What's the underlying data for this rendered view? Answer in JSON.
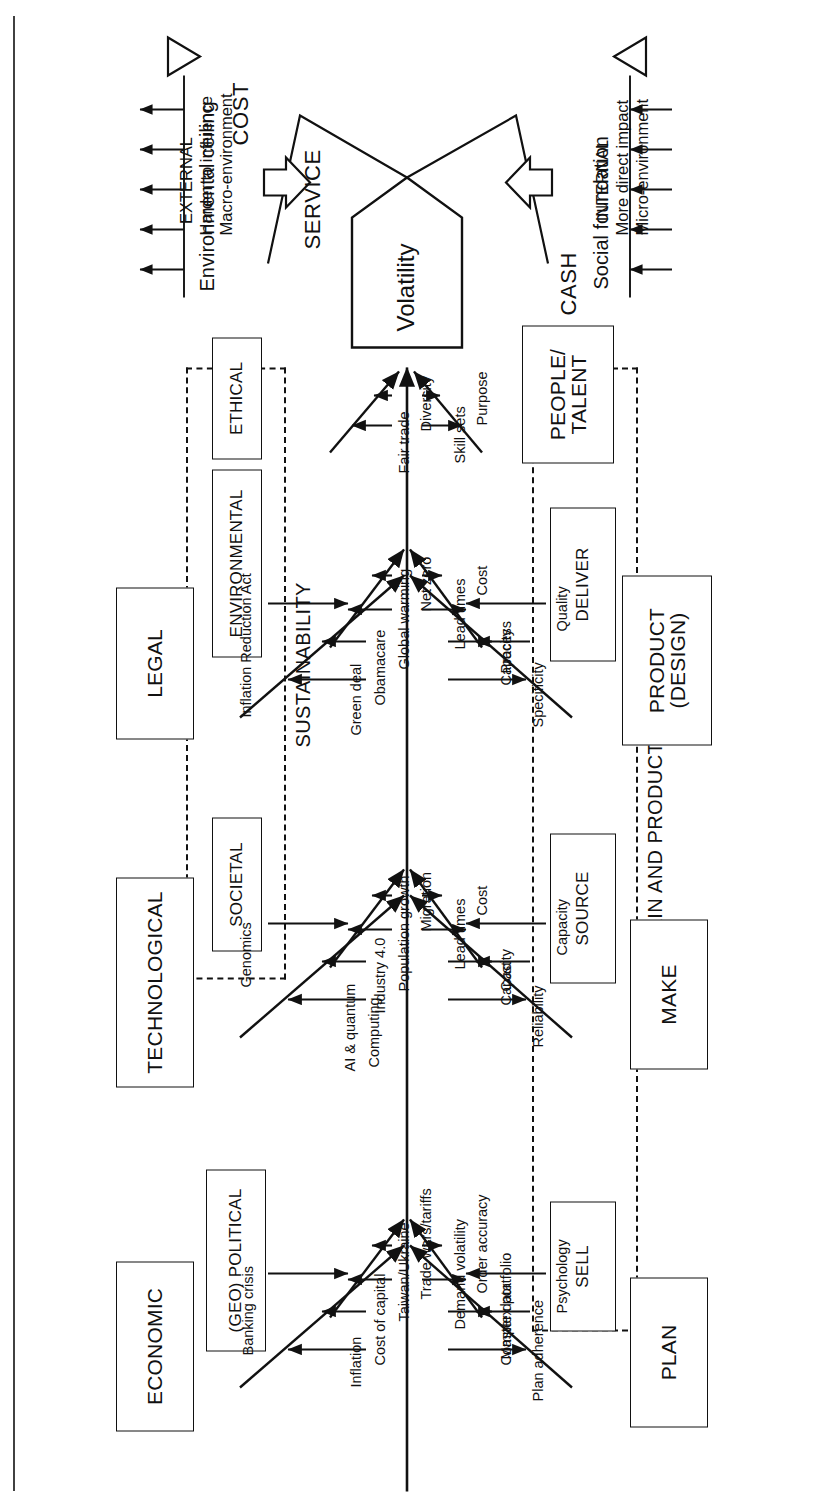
{
  "diagram": {
    "head_label": "Volatility",
    "external": {
      "line1": "EXTERNAL",
      "line2": "Harder to influence",
      "line3": "Macro-environment",
      "arrow_icon": "arrow-right-outline"
    },
    "internal": {
      "line1": "INTERNAL",
      "line2": "More direct impact",
      "line3": "Micro-environment",
      "arrow_icon": "arrow-left-outline"
    },
    "ceiling": {
      "label": "Environmental ceiling",
      "marker_icon": "triangle-down-outline",
      "arrow_count": 5,
      "arrow_direction": "outward"
    },
    "foundation": {
      "label": "Social foundation",
      "marker_icon": "triangle-up-outline",
      "arrow_count": 5,
      "arrow_direction": "inward"
    },
    "wedges": [
      {
        "label": "SERVICE",
        "side": "top"
      },
      {
        "label": "COST",
        "side": "bottom"
      },
      {
        "label": "CASH",
        "side": "bottom"
      }
    ],
    "group_boxes": [
      {
        "label": "SUSTAINABILITY",
        "members": [
          "SOCIETAL",
          "ENVIRONMENTAL",
          "ETHICAL"
        ]
      },
      {
        "label": "SUPPLY CHAIN AND PRODUCT DESIGN",
        "members": [
          "PLAN",
          "SOURCE",
          "MAKE",
          "DELIVER",
          "PRODUCT (DESIGN)"
        ]
      }
    ],
    "sub_boxes": [
      {
        "label": "SOCIETAL"
      },
      {
        "label": "ENVIRONMENTAL"
      },
      {
        "label": "ETHICAL"
      }
    ],
    "external_bones": [
      {
        "name": "ECONOMIC",
        "causes": [
          {
            "label": "Inflation",
            "direction": "up"
          },
          {
            "label": "Cost of capital",
            "direction": "up"
          },
          {
            "label": "Banking crisis",
            "direction": "down"
          }
        ]
      },
      {
        "name": "TECHNOLOGICAL",
        "causes": [
          {
            "label": "AI & quantum",
            "direction": "up"
          },
          {
            "label": "Computing",
            "direction": "up"
          },
          {
            "label": "Industry 4.0",
            "direction": "up"
          },
          {
            "label": "Genomics",
            "direction": "down"
          }
        ]
      },
      {
        "name": "LEGAL",
        "causes": [
          {
            "label": "Green deal",
            "direction": "up"
          },
          {
            "label": "Obamacare",
            "direction": "up"
          },
          {
            "label": "Inflation Reduction Act",
            "direction": "down"
          }
        ]
      }
    ],
    "sustainability_bones": [
      {
        "name": "SOCIETAL",
        "causes": [
          {
            "label": "Population growth",
            "direction": "up"
          },
          {
            "label": "Migration",
            "direction": "up"
          }
        ]
      },
      {
        "name": "ENVIRONMENTAL",
        "causes": [
          {
            "label": "Global warming",
            "direction": "up"
          },
          {
            "label": "Net zero",
            "direction": "up"
          }
        ]
      },
      {
        "name": "ETHICAL",
        "causes": [
          {
            "label": "Fair trade",
            "direction": "up"
          },
          {
            "label": "Diversity",
            "direction": "up"
          }
        ]
      }
    ],
    "geo_political": {
      "name": "(GEO) POLITICAL",
      "causes": [
        {
          "label": "Taiwan/Ukraine",
          "direction": "up"
        },
        {
          "label": "Trade wars/tariffs",
          "direction": "up"
        }
      ]
    },
    "internal_bones": [
      {
        "name": "SELL",
        "causes": [
          {
            "label": "Demand volatility",
            "direction": "up"
          },
          {
            "label": "Order accuracy",
            "direction": "up"
          },
          {
            "label": "Complex portfolio",
            "direction": "down"
          }
        ]
      },
      {
        "name": "SOURCE",
        "causes": [
          {
            "label": "Lead times",
            "direction": "up"
          },
          {
            "label": "Cost",
            "direction": "up"
          },
          {
            "label": "Capacity",
            "direction": "down"
          }
        ]
      },
      {
        "name": "DELIVER",
        "causes": [
          {
            "label": "Lead times",
            "direction": "up"
          },
          {
            "label": "Cost",
            "direction": "up"
          },
          {
            "label": "Capacity",
            "direction": "down"
          }
        ]
      },
      {
        "name": "PEOPLE/\nTALENT",
        "causes": [
          {
            "label": "Skill sets",
            "direction": "up"
          },
          {
            "label": "Purpose",
            "direction": "up"
          }
        ]
      },
      {
        "name": "PLAN",
        "causes": [
          {
            "label": "Plan adherence",
            "direction": "up"
          },
          {
            "label": "Master data",
            "direction": "up"
          },
          {
            "label": "Psychology",
            "direction": "down"
          }
        ]
      },
      {
        "name": "MAKE",
        "causes": [
          {
            "label": "Reliability",
            "direction": "up"
          },
          {
            "label": "Cost",
            "direction": "up"
          },
          {
            "label": "Capacity",
            "direction": "down"
          }
        ]
      },
      {
        "name": "PRODUCT\n(DESIGN)",
        "causes": [
          {
            "label": "Specificity",
            "direction": "up"
          },
          {
            "label": "Process",
            "direction": "up"
          },
          {
            "label": "Quality",
            "direction": "down"
          }
        ]
      }
    ],
    "labels": {
      "people_talent_line1": "PEOPLE/",
      "people_talent_line2": "TALENT",
      "product_line1": "PRODUCT",
      "product_line2": "(DESIGN)",
      "sell": "SELL",
      "source": "SOURCE",
      "deliver": "DELIVER",
      "plan": "PLAN",
      "make": "MAKE",
      "economic": "ECONOMIC",
      "technological": "TECHNOLOGICAL",
      "legal": "LEGAL",
      "geo_political": "(GEO) POLITICAL",
      "societal": "SOCIETAL",
      "environmental": "ENVIRONMENTAL",
      "ethical": "ETHICAL",
      "sustainability": "SUSTAINABILITY",
      "supply_chain": "SUPPLY CHAIN AND PRODUCT DESIGN",
      "service": "SERVICE",
      "cost": "COST",
      "cash": "CASH",
      "volatility": "Volatility",
      "environmental_ceiling": "Environmental ceiling",
      "social_foundation": "Social foundation",
      "ext1": "EXTERNAL",
      "ext2": "Harder to influence",
      "ext3": "Macro-environment",
      "int1": "INTERNAL",
      "int2": "More direct impact",
      "int3": "Micro-environment",
      "c_inflation": "Inflation",
      "c_cost_of_capital": "Cost of capital",
      "c_banking_crisis": "Banking crisis",
      "c_ai_quantum": "AI & quantum",
      "c_computing": "Computing",
      "c_industry40": "Industry 4.0",
      "c_genomics": "Genomics",
      "c_green_deal": "Green deal",
      "c_obamacare": "Obamacare",
      "c_ira": "Inflation Reduction Act",
      "c_taiwan": "Taiwan/Ukraine",
      "c_trade_wars": "Trade wars/tariffs",
      "c_population": "Population growth",
      "c_migration": "Migration",
      "c_global_warming": "Global warming",
      "c_net_zero": "Net zero",
      "c_fair_trade": "Fair trade",
      "c_diversity": "Diversity",
      "c_demand_vol": "Demand volatility",
      "c_order_acc": "Order accuracy",
      "c_complex_portfolio": "Complex portfolio",
      "c_lead_times": "Lead times",
      "c_cost": "Cost",
      "c_capacity": "Capacity",
      "c_lead_times2": "Lead times",
      "c_cost2": "Cost",
      "c_capacity2": "Capacity",
      "c_skill_sets": "Skill sets",
      "c_purpose": "Purpose",
      "c_plan_adherence": "Plan adherence",
      "c_master_data": "Master data",
      "c_psychology": "Psychology",
      "c_reliability": "Reliability",
      "c_cost3": "Cost",
      "c_capacity3": "Capacity",
      "c_specificity": "Specificity",
      "c_process": "Process",
      "c_quality": "Quality"
    }
  },
  "colors": {
    "ink": "#111111",
    "paper": "#ffffff"
  }
}
